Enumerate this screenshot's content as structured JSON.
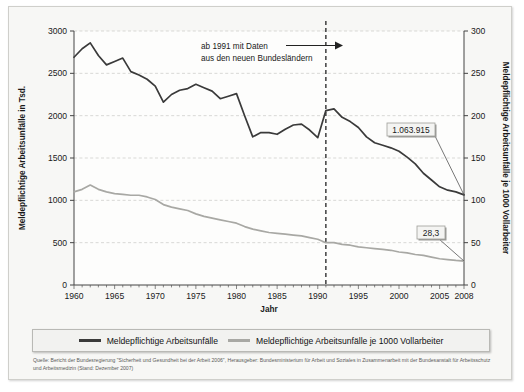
{
  "chart_data": {
    "type": "line",
    "title": "",
    "xlabel": "Jahr",
    "ylabel": "Meldepflichtige Arbeitsunfälle in Tsd.",
    "y2label": "Meldepflichtige Arbeitsunfälle je 1000 Vollarbeiter",
    "xlim": [
      1960,
      2008
    ],
    "ylim": [
      0,
      3000
    ],
    "y2lim": [
      0,
      300
    ],
    "grid": true,
    "legend_position": "bottom",
    "xticks": [
      1960,
      1965,
      1970,
      1975,
      1980,
      1985,
      1990,
      1995,
      2000,
      2005,
      2008
    ],
    "yticks": [
      0,
      500,
      1000,
      1500,
      2000,
      2500,
      3000
    ],
    "y2ticks": [
      0,
      50,
      100,
      150,
      200,
      250,
      300
    ],
    "x": [
      1960,
      1961,
      1962,
      1963,
      1964,
      1965,
      1966,
      1967,
      1968,
      1969,
      1970,
      1971,
      1972,
      1973,
      1974,
      1975,
      1976,
      1977,
      1978,
      1979,
      1980,
      1981,
      1982,
      1983,
      1984,
      1985,
      1986,
      1987,
      1988,
      1989,
      1990,
      1991,
      1992,
      1993,
      1994,
      1995,
      1996,
      1997,
      1998,
      1999,
      2000,
      2001,
      2002,
      2003,
      2004,
      2005,
      2006,
      2007,
      2008
    ],
    "series": [
      {
        "name": "Meldepflichtige Arbeitsunfälle",
        "axis": "left",
        "color": "#3a3a3a",
        "values": [
          2690,
          2790,
          2860,
          2710,
          2600,
          2640,
          2680,
          2520,
          2480,
          2430,
          2350,
          2160,
          2250,
          2300,
          2320,
          2370,
          2330,
          2290,
          2200,
          2230,
          2260,
          2000,
          1750,
          1800,
          1800,
          1780,
          1840,
          1890,
          1900,
          1830,
          1740,
          2060,
          2080,
          1980,
          1930,
          1860,
          1750,
          1680,
          1650,
          1620,
          1580,
          1510,
          1430,
          1320,
          1240,
          1160,
          1120,
          1100,
          1064
        ]
      },
      {
        "name": "Meldepflichtige Arbeitsunfälle je 1000 Vollarbeiter",
        "axis": "right",
        "color": "#a8a8a4",
        "values": [
          110,
          113,
          118,
          113,
          110,
          108,
          107,
          106,
          106,
          104,
          101,
          95,
          92,
          90,
          88,
          84,
          81,
          79,
          77,
          75,
          73,
          69,
          66,
          64,
          62,
          61,
          60,
          59,
          58,
          56,
          54,
          50,
          50,
          48,
          47,
          45,
          44,
          43,
          42,
          41,
          39,
          38,
          36,
          35,
          33,
          31,
          30,
          29,
          28.3
        ]
      }
    ],
    "annotations": [
      {
        "name": "east-germany-note",
        "text_line1": "ab 1991 mit Daten",
        "text_line2": "aus den neuen Bundesländern",
        "year": 1991
      },
      {
        "name": "value-label-accidents",
        "text": "1.063.915",
        "year": 2008,
        "value": 1064
      },
      {
        "name": "value-label-rate",
        "text": "28,3",
        "year": 2008,
        "value": 28.3
      }
    ],
    "reference_line": {
      "name": "year-1991-divider",
      "year": 1991,
      "style": "dashed"
    }
  },
  "legend": {
    "items": [
      {
        "label": "Meldepflichtige Arbeitsunfälle",
        "color": "#3a3a3a"
      },
      {
        "label": "Meldepflichtige Arbeitsunfälle je 1000 Vollarbeiter",
        "color": "#a8a8a4"
      }
    ]
  },
  "source": {
    "text": "Quelle: Bericht der Bundesregierung \"Sicherheit und Gesundheit bei der Arbeit 2006\", Herausgeber: Bundesministerium für Arbeit und Soziales in Zusammenarbeit mit der Bundesanstalt für Arbeitsschutz und Arbeitsmedizin (Stand: Dezember 2007)"
  }
}
